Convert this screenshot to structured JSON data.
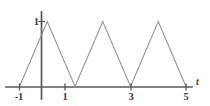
{
  "figure": {
    "background_color": "#ffffff",
    "axis_color": "#56585c",
    "curve_color": "#8d8f93",
    "label_color": "#3a3c40"
  },
  "chart_data": {
    "type": "line",
    "title": "",
    "subtitle": "",
    "xlabel": "t",
    "ylabel": "",
    "grid": false,
    "legend": null,
    "xlim": [
      -1.35,
      5.6
    ],
    "ylim": [
      0,
      1.22
    ],
    "x_tick_labels": [
      "-1",
      "1",
      "3",
      "5"
    ],
    "x_tick_values": [
      -1,
      1,
      3,
      5
    ],
    "y_tick_labels": [
      "1"
    ],
    "y_tick_values": [
      1
    ],
    "series": [
      {
        "name": "triangular wave",
        "x": [
          -1,
          0,
          1,
          2,
          3,
          4,
          5
        ],
        "values": [
          0,
          1,
          0,
          1,
          0,
          1,
          0
        ]
      }
    ],
    "annotations": []
  }
}
